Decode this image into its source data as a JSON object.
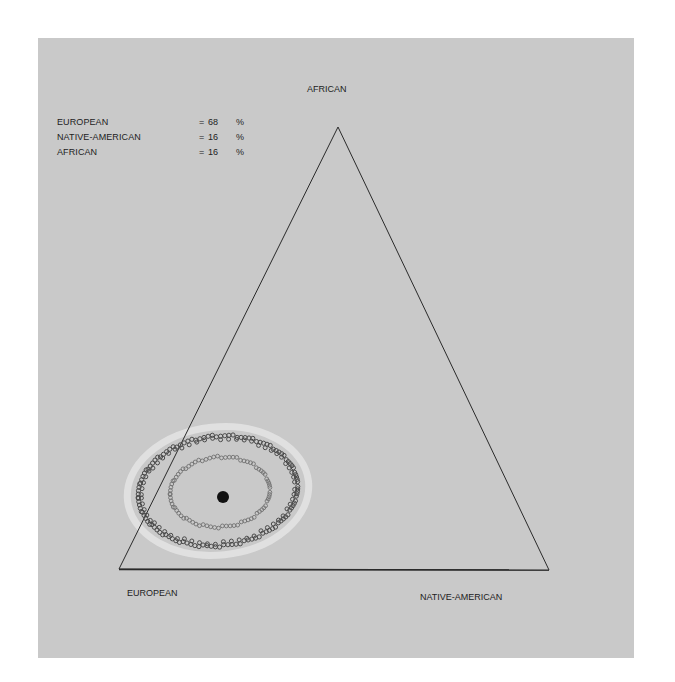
{
  "chart_data": {
    "type": "scatter",
    "subtype": "ternary",
    "title": "",
    "vertices": {
      "top": "AFRICAN",
      "bottom_left": "EUROPEAN",
      "bottom_right": "NATIVE-AMERICAN"
    },
    "estimate": {
      "EUROPEAN": 68,
      "NATIVE-AMERICAN": 16,
      "AFRICAN": 16
    },
    "point_estimate_marker": "filled black dot",
    "confidence_contours": [
      {
        "name": "inner contour",
        "style": "small open circles, light gray"
      },
      {
        "name": "outer contour",
        "style": "small open circles, dark gray"
      },
      {
        "name": "outer halo",
        "style": "whitish band"
      }
    ],
    "grid": false,
    "legend_position": "top-left"
  },
  "legend": {
    "rows": [
      {
        "label": "EUROPEAN",
        "eq": "=",
        "value": "68",
        "unit": "%"
      },
      {
        "label": "NATIVE-AMERICAN",
        "eq": "=",
        "value": "16",
        "unit": "%"
      },
      {
        "label": "AFRICAN",
        "eq": "=",
        "value": "16",
        "unit": "%"
      }
    ]
  },
  "labels": {
    "top": "AFRICAN",
    "bottom_left": "EUROPEAN",
    "bottom_right": "NATIVE-AMERICAN"
  },
  "colors": {
    "background": "#c9c9c9",
    "line": "#2a2a2a",
    "outer_ring": "#4a4a4a",
    "inner_ring": "#6e6e6e",
    "halo": "#e6e6e6",
    "dot": "#111111"
  }
}
